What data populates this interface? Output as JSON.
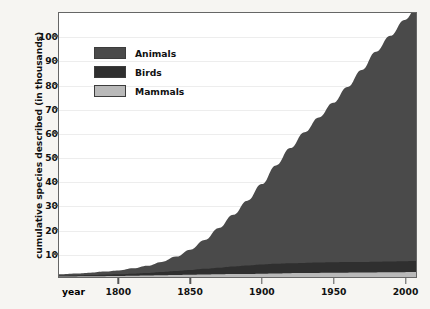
{
  "chart_data": {
    "type": "area",
    "title": "",
    "subtitle": "",
    "xlabel": "year",
    "ylabel": "cumulative species described (in thousands)",
    "stacked": true,
    "grid": true,
    "legend_position": "top-left",
    "xlim": [
      1758,
      2008
    ],
    "ylim": [
      0,
      110
    ],
    "x_ticks": [
      1800,
      1850,
      1900,
      1950,
      2000
    ],
    "x_tick_labels": [
      "1800",
      "1850",
      "1900",
      "1950",
      "2000"
    ],
    "y_ticks": [
      10,
      20,
      30,
      40,
      50,
      60,
      70,
      80,
      90,
      100
    ],
    "y_tick_labels": [
      "10",
      "20",
      "30",
      "40",
      "50",
      "60",
      "70",
      "80",
      "90",
      "100"
    ],
    "x": [
      1758,
      1770,
      1780,
      1790,
      1800,
      1810,
      1820,
      1830,
      1840,
      1850,
      1860,
      1870,
      1880,
      1890,
      1900,
      1910,
      1920,
      1930,
      1940,
      1950,
      1960,
      1970,
      1980,
      1990,
      2000,
      2008
    ],
    "series": [
      {
        "name": "Mammals",
        "color": "#b9b9b9",
        "values": [
          0.2,
          0.25,
          0.3,
          0.35,
          0.4,
          0.5,
          0.6,
          0.7,
          0.8,
          0.9,
          1.0,
          1.1,
          1.2,
          1.3,
          1.4,
          1.5,
          1.6,
          1.65,
          1.7,
          1.75,
          1.8,
          1.85,
          1.9,
          1.95,
          2.0,
          2.05
        ]
      },
      {
        "name": "Birds",
        "color": "#2f2f2f",
        "values": [
          0.3,
          0.4,
          0.5,
          0.6,
          0.7,
          0.9,
          1.1,
          1.4,
          1.7,
          2.0,
          2.4,
          2.8,
          3.2,
          3.5,
          3.8,
          4.0,
          4.1,
          4.2,
          4.3,
          4.35,
          4.4,
          4.45,
          4.5,
          4.55,
          4.6,
          4.62
        ]
      },
      {
        "name": "Animals",
        "color": "#4a4a4a",
        "values": [
          0.6,
          0.8,
          1.0,
          1.3,
          1.6,
          2.2,
          3.0,
          4.2,
          6.0,
          8.5,
          12.0,
          16.5,
          21.5,
          27.0,
          33.5,
          41.0,
          48.0,
          54.5,
          60.5,
          66.5,
          73.0,
          80.0,
          87.5,
          94.0,
          100.5,
          105.0
        ]
      }
    ],
    "totals_note": "values are cumulative species described, in thousands"
  },
  "axis": {
    "x_name_label": "year"
  },
  "legend": {
    "items": [
      {
        "label": "Animals",
        "color": "#4a4a4a"
      },
      {
        "label": "Birds",
        "color": "#2f2f2f"
      },
      {
        "label": "Mammals",
        "color": "#b9b9b9"
      }
    ]
  },
  "colors": {
    "page_background": "#f6f5f2",
    "plot_background": "#ffffff",
    "frame": "#666666",
    "gridline": "#ededed",
    "text": "#111111"
  }
}
